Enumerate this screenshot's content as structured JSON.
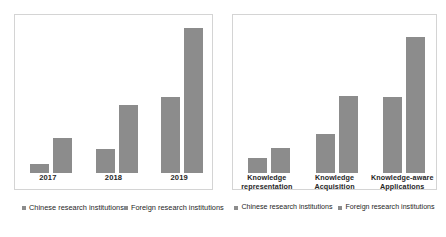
{
  "figure": {
    "background": "#ffffff",
    "bar_color": "#8c8c8c",
    "panel_border_color": "#d4d4d4",
    "text_color": "#262626"
  },
  "chart_data": [
    {
      "id": "left",
      "type": "bar",
      "title": "",
      "xlabel": "",
      "ylabel": "",
      "grid": false,
      "legend_position": "bottom",
      "axis_visible": false,
      "categories": [
        "2017",
        "2018",
        "2019"
      ],
      "series": [
        {
          "name": "Chinese research institutions",
          "color": "#8c8c8c",
          "values": [
            9,
            24,
            76
          ]
        },
        {
          "name": "Foreign research institutions",
          "color": "#8c8c8c",
          "values": [
            35,
            68,
            145
          ]
        }
      ],
      "ylim": [
        0,
        158
      ],
      "legend": [
        "Chinese research institutions",
        "Foreign research institutions"
      ]
    },
    {
      "id": "right",
      "type": "bar",
      "title": "",
      "xlabel": "",
      "ylabel": "",
      "grid": false,
      "legend_position": "bottom",
      "axis_visible": false,
      "categories": [
        "Knowledge representation",
        "Knowledge Acquisition",
        "Knowledge-aware Applications"
      ],
      "series": [
        {
          "name": "Chinese research institutions",
          "color": "#8c8c8c",
          "values": [
            15,
            39,
            76
          ]
        },
        {
          "name": "Foreign research institutions",
          "color": "#8c8c8c",
          "values": [
            25,
            77,
            136
          ]
        }
      ],
      "ylim": [
        0,
        158
      ],
      "legend": [
        "Chinese research institutions",
        "Foreign research institutions"
      ]
    }
  ]
}
